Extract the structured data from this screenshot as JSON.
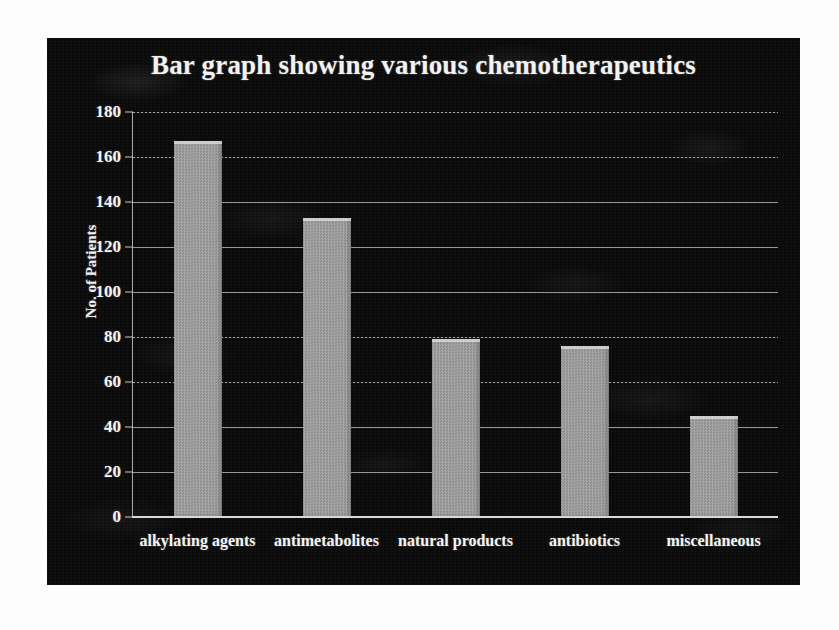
{
  "chart_data": {
    "type": "bar",
    "title": "Bar graph showing various chemotherapeutics",
    "xlabel": "",
    "ylabel": "No. of Patients",
    "categories": [
      "alkylating agents",
      "antimetabolites",
      "natural products",
      "antibiotics",
      "miscellaneous"
    ],
    "values": [
      167,
      133,
      79,
      76,
      45
    ],
    "ylim": [
      0,
      180
    ],
    "yticks": [
      0,
      20,
      40,
      60,
      80,
      100,
      120,
      140,
      160,
      180
    ],
    "ytick_labels": [
      "0",
      "20",
      "40",
      "60",
      "80",
      "100",
      "120",
      "140",
      "160",
      "180"
    ],
    "grid": true,
    "legend": "none",
    "bar_color": "#9c9c9c",
    "background_color": "#0a0a0a",
    "text_color": "#f4f4f4",
    "gridline_color": "#b9b9b9"
  }
}
